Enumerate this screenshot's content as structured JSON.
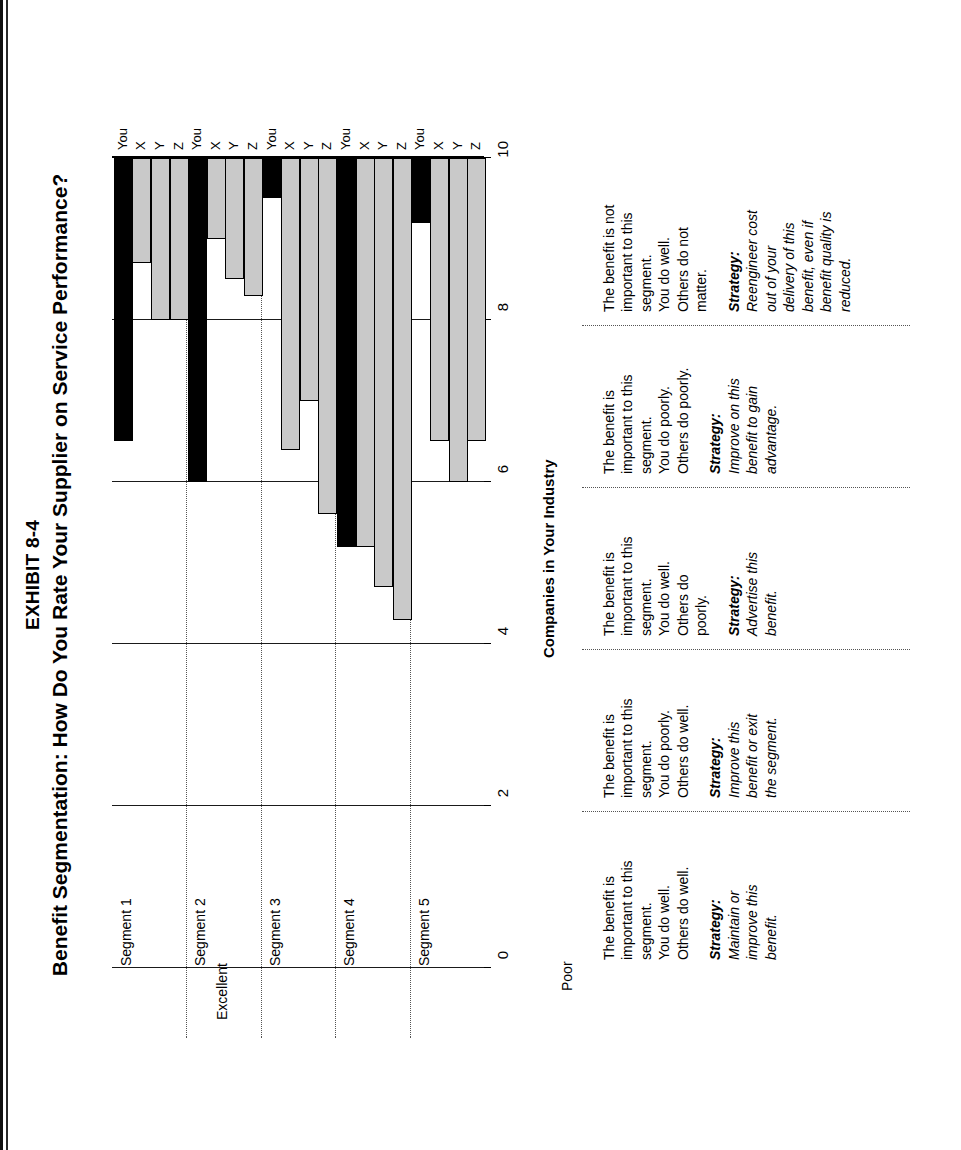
{
  "exhibit": {
    "number": "EXHIBIT 8-4",
    "title": "Benefit Segmentation: How Do You Rate Your Supplier on Service Performance?"
  },
  "axes": {
    "y_top_label": "Excellent",
    "y_bottom_label": "Poor",
    "x_title": "Companies in Your Industry",
    "y_ticks": [
      "10",
      "8",
      "6",
      "4",
      "2",
      "0"
    ]
  },
  "series_labels": [
    "You",
    "X",
    "Y",
    "Z"
  ],
  "segments": [
    {
      "name": "Segment 1",
      "description": "The benefit is\nimportant to this\nsegment.\nYou do well.\nOthers do well.",
      "strategy_label": "Strategy:",
      "strategy": "Maintain or\nimprove this\nbenefit."
    },
    {
      "name": "Segment 2",
      "description": "The benefit is\nimportant to this\nsegment.\nYou do poorly.\nOthers do well.",
      "strategy_label": "Strategy:",
      "strategy": "Improve this\nbenefit or exit\nthe segment."
    },
    {
      "name": "Segment 3",
      "description": "The benefit is\nimportant to this\nsegment.\nYou do well.\nOthers do\npoorly.",
      "strategy_label": "Strategy:",
      "strategy": "Advertise this\nbenefit."
    },
    {
      "name": "Segment 4",
      "description": "The benefit is\nimportant to this\nsegment.\nYou do poorly.\nOthers do poorly.",
      "strategy_label": "Strategy:",
      "strategy": "Improve on this\nbenefit to gain\nadvantage."
    },
    {
      "name": "Segment 5",
      "description": "The benefit is not\nimportant to this\nsegment.\nYou do well.\nOthers do not\nmatter.",
      "strategy_label": "Strategy:",
      "strategy": "Reengineer cost\nout of your\ndelivery of this\nbenefit, even if\nbenefit quality is\nreduced."
    }
  ],
  "colors": {
    "you_bar": "#000000",
    "other_bar": "#c9c9c9",
    "axis": "#000000",
    "divider": "#555555"
  },
  "chart_data": {
    "type": "bar",
    "title": "Benefit Segmentation: How Do You Rate Your Supplier on Service Performance?",
    "xlabel": "Companies in Your Industry",
    "ylabel": "Rating (Poor to Excellent)",
    "ylim": [
      0,
      10
    ],
    "grid": true,
    "legend": "none",
    "orientation": "vertical-grouped",
    "categories": [
      "Segment 1",
      "Segment 2",
      "Segment 3",
      "Segment 4",
      "Segment 5"
    ],
    "series": [
      {
        "name": "You",
        "values": [
          6.5,
          6.0,
          9.5,
          5.2,
          9.2
        ]
      },
      {
        "name": "X",
        "values": [
          8.7,
          9.0,
          6.4,
          5.2,
          6.5
        ]
      },
      {
        "name": "Y",
        "values": [
          8.0,
          8.5,
          7.0,
          4.7,
          6.0
        ]
      },
      {
        "name": "Z",
        "values": [
          8.0,
          8.3,
          5.6,
          4.3,
          6.5
        ]
      }
    ]
  }
}
